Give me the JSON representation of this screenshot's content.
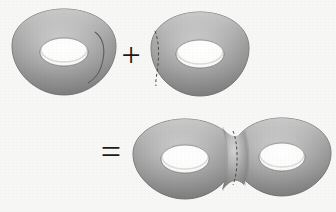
{
  "figure": {
    "background_color": "#f7f7f5",
    "operators": [
      {
        "name": "plus",
        "symbol": "+",
        "x": 131,
        "y": 56
      },
      {
        "name": "equals",
        "symbol": "=",
        "x": 111,
        "y": 155
      }
    ],
    "shapes": [
      {
        "id": "torus-left-summand",
        "label": "torus",
        "role": "first summand",
        "center_x": 64,
        "center_y": 52,
        "outer_rx": 52,
        "outer_ry": 43,
        "hole_rx": 24,
        "hole_ry": 14,
        "cut_side": "right",
        "cut_style": "solid",
        "cut_x": 104
      },
      {
        "id": "torus-right-summand",
        "label": "torus",
        "role": "second summand",
        "center_x": 200,
        "center_y": 54,
        "outer_rx": 49,
        "outer_ry": 43,
        "hole_rx": 24,
        "hole_ry": 14,
        "cut_side": "left",
        "cut_style": "dashed",
        "cut_x": 158
      },
      {
        "id": "genus-two-left-lobe",
        "label": "double torus left lobe",
        "role": "result",
        "center_x": 185,
        "center_y": 159,
        "outer_rx": 52,
        "outer_ry": 41,
        "hole_rx": 24,
        "hole_ry": 14,
        "cut_side": "right",
        "cut_style": "dashed",
        "cut_x": 234
      },
      {
        "id": "genus-two-right-lobe",
        "label": "double torus right lobe",
        "role": "result",
        "center_x": 282,
        "center_y": 157,
        "outer_rx": 49,
        "outer_ry": 40,
        "hole_rx": 23,
        "hole_ry": 14,
        "cut_side": "left",
        "cut_style": "none",
        "cut_x": 234
      }
    ],
    "colors": {
      "surface_light": "#d2d2d2",
      "surface_mid": "#a8a8a8",
      "surface_dark": "#7f7f7f",
      "surface_edge": "#6d6d6d",
      "hole_fill": "#fbfbfa",
      "outline": "#6a6a6a",
      "cut_line": "#4a4a4a",
      "operator": "#1a1a1a"
    }
  }
}
